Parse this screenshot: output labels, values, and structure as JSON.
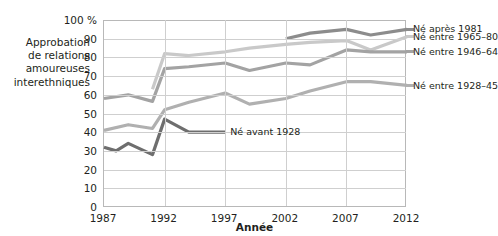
{
  "axes": {
    "y_title_lines": [
      "Approbation",
      "de relations",
      "amoureuses",
      "interethniques"
    ],
    "y_top_label": "100 %",
    "y_ticks": [
      "90",
      "80",
      "70",
      "60",
      "50",
      "40",
      "30",
      "20",
      "10",
      "0"
    ],
    "x_title": "Année",
    "x_ticks": [
      "1987",
      "1992",
      "1997",
      "2002",
      "2007",
      "2012"
    ]
  },
  "legend": {
    "items": [
      {
        "label": "Né après 1981",
        "color": "#8c8c8c"
      },
      {
        "label": "Né entre 1965–80",
        "color": "#c9c9c9"
      },
      {
        "label": "Né entre 1946–64",
        "color": "#a3a3a3"
      },
      {
        "label": "Né entre 1928–45",
        "color": "#b0b0b0"
      }
    ]
  },
  "inline_label": {
    "label": "Né avant 1928",
    "color": "#6e6e6e"
  },
  "chart_data": {
    "type": "line",
    "title": "",
    "xlabel": "Année",
    "ylabel": "Approbation de relations amoureuses interethniques",
    "xlim": [
      1987,
      2012
    ],
    "ylim": [
      0,
      100
    ],
    "ytick_values": [
      0,
      10,
      20,
      30,
      40,
      50,
      60,
      70,
      80,
      90,
      100
    ],
    "xtick_values": [
      1987,
      1992,
      1997,
      2002,
      2007,
      2012
    ],
    "grid": true,
    "legend_position": "right",
    "unit": "%",
    "series": [
      {
        "name": "Né après 1981",
        "color": "#8c8c8c",
        "x": [
          2002,
          2004,
          2007,
          2009,
          2012
        ],
        "values": [
          90,
          93,
          95,
          92,
          95
        ]
      },
      {
        "name": "Né entre 1965–80",
        "color": "#c9c9c9",
        "x": [
          1991,
          1992,
          1994,
          1997,
          1999,
          2002,
          2004,
          2007,
          2009,
          2012
        ],
        "values": [
          63,
          82,
          81,
          83,
          85,
          87,
          88,
          89,
          84,
          91
        ]
      },
      {
        "name": "Né entre 1946–64",
        "color": "#a3a3a3",
        "x": [
          1987,
          1989,
          1991,
          1992,
          1994,
          1997,
          1999,
          2002,
          2004,
          2007,
          2009,
          2012
        ],
        "values": [
          58,
          60,
          56.5,
          74,
          75,
          77,
          73,
          77,
          76,
          84,
          83,
          83
        ]
      },
      {
        "name": "Né entre 1928–45",
        "color": "#b0b0b0",
        "x": [
          1987,
          1989,
          1991,
          1992,
          1994,
          1997,
          1999,
          2002,
          2004,
          2007,
          2009,
          2012
        ],
        "values": [
          41,
          44,
          42,
          52,
          56,
          61,
          55,
          58,
          62,
          67,
          67,
          65
        ]
      },
      {
        "name": "Né avant 1928",
        "color": "#6e6e6e",
        "x": [
          1987,
          1988,
          1989,
          1991,
          1992,
          1994,
          1997
        ],
        "values": [
          32,
          30,
          34,
          28,
          47,
          40,
          40
        ]
      }
    ]
  }
}
